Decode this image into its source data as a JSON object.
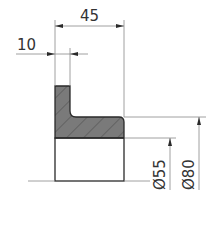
{
  "drawing": {
    "type": "technical-section-drawing",
    "colors": {
      "outline": "#2a2a2a",
      "hatch_fill": "#7a7a7a",
      "hatch_lines": "#4a4a4a",
      "dimension_lines": "#888888",
      "text": "#333333"
    },
    "dimensions": {
      "overall_width": {
        "label": "45",
        "value": 45
      },
      "flange_width": {
        "label": "10",
        "value": 10
      },
      "inner_diameter": {
        "label": "Ø55",
        "value": 55
      },
      "outer_diameter": {
        "label": "Ø80",
        "value": 80
      }
    }
  }
}
